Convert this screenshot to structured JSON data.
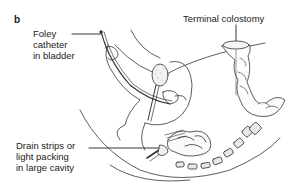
{
  "figure": {
    "panel_label": "b",
    "labels": {
      "foley": [
        "Foley",
        "catheter",
        "in bladder"
      ],
      "colostomy": [
        "Terminal colostomy"
      ],
      "drain": [
        "Drain strips or",
        "light packing",
        "in large cavity"
      ]
    }
  }
}
